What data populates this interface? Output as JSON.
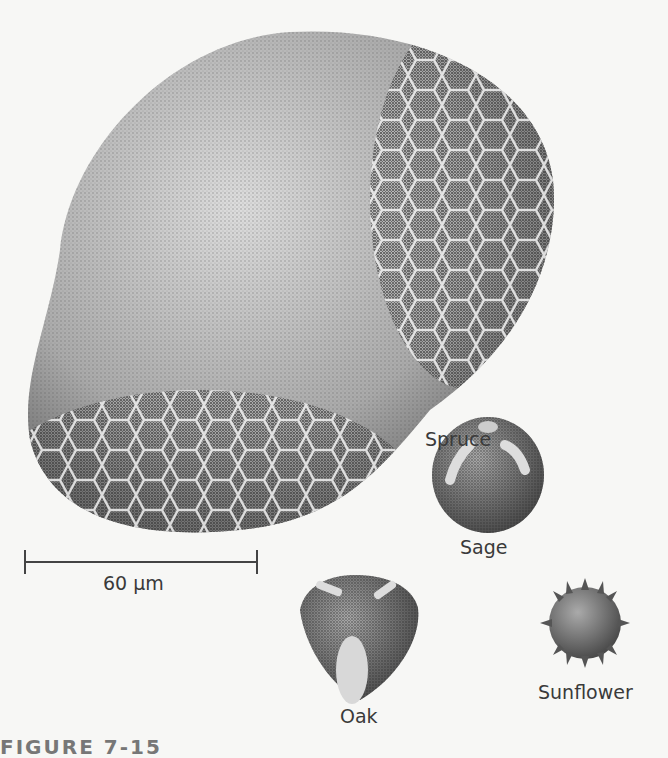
{
  "figure": {
    "caption_partial": "FIGURE 7-15",
    "scale_bar": {
      "label": "60 µm"
    },
    "specimens": [
      {
        "name": "Spruce",
        "label": "Spruce"
      },
      {
        "name": "Sage",
        "label": "Sage"
      },
      {
        "name": "Oak",
        "label": "Oak"
      },
      {
        "name": "Sunflower",
        "label": "Sunflower"
      }
    ]
  },
  "colors": {
    "background": "#f7f7f5",
    "ink": "#3a3a3a",
    "stipple_dark": "#4a4a4a",
    "stipple_light": "#c8c8c8"
  }
}
